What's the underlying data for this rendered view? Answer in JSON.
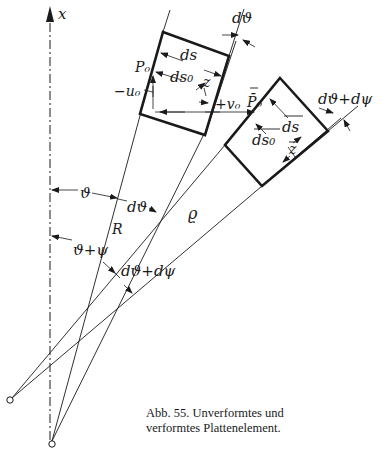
{
  "figure": {
    "axis_label": "x",
    "labels": {
      "d_theta_top": "dϑ",
      "ds": "ds",
      "ds0": "ds₀",
      "z": "z",
      "P0": "P₀",
      "minus_u0": "−u₀",
      "plus_v0": "+v₀",
      "P0_bar": "P̄₀",
      "d_theta_plus_d_psi_top": "dϑ+dψ",
      "ds_bar": "ds",
      "ds0_bar": "ds₀",
      "z_bar": "z",
      "theta": "ϑ",
      "d_theta_mid": "dϑ",
      "R": "R",
      "rho": "ϱ",
      "theta_plus_psi": "ϑ+ψ",
      "d_theta_plus_d_psi_mid": "dϑ+dψ"
    },
    "caption": {
      "line1": "Abb. 55. Unverformtes und",
      "line2": "verformtes  Plattenelement."
    },
    "colors": {
      "ink": "#1a1a1a",
      "background": "#ffffff"
    }
  }
}
